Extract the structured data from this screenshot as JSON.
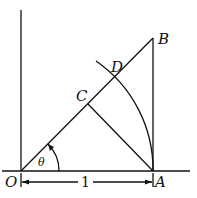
{
  "diagram": {
    "type": "geometry",
    "points": {
      "O": {
        "label": "O",
        "x": 21,
        "y": 171
      },
      "A": {
        "label": "A",
        "x": 153,
        "y": 171
      },
      "B": {
        "label": "B",
        "x": 153,
        "y": 38
      },
      "C": {
        "label": "C",
        "x": 88,
        "y": 104
      },
      "D": {
        "label": "D",
        "x": 115,
        "y": 78
      }
    },
    "angle_label": "θ",
    "length_label": "1",
    "colors": {
      "stroke": "#111111",
      "background": "#ffffff"
    }
  }
}
